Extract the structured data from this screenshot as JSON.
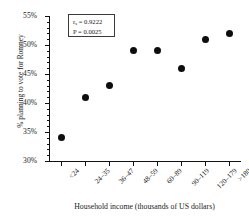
{
  "chart_data": {
    "type": "scatter",
    "title": "",
    "xlabel": "Household income (thousands of US dollars)",
    "ylabel": "% planning to vote for Romney",
    "categories": [
      "<24",
      "24–35",
      "36–47",
      "48–59",
      "60–89",
      "90–119",
      "120–179",
      ">180"
    ],
    "values": [
      34,
      41,
      43,
      49,
      49,
      46,
      51,
      52
    ],
    "ylim": [
      30,
      55
    ],
    "ytick_labels": [
      "30%",
      "35%",
      "40%",
      "45%",
      "50%",
      "55%"
    ],
    "ytick_values": [
      30,
      35,
      40,
      45,
      50,
      55
    ],
    "yminor_step": 1,
    "grid": false,
    "legend": null,
    "marker": {
      "shape": "circle",
      "color": "#0d0d0d",
      "size_px": 7
    },
    "annotations": {
      "stat_symbol": "r",
      "stat_subscript": "s",
      "stat_equals": " = 0.9222",
      "pvalue_line": "P = 0.0025"
    }
  },
  "axis": {
    "y_title": "% planning to vote for Romney",
    "x_title": "Household income (thousands of US dollars)"
  }
}
